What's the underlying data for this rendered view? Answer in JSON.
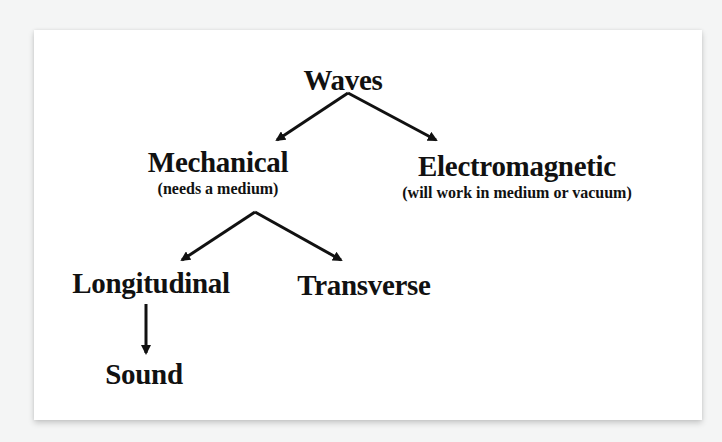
{
  "diagram": {
    "root": {
      "label": "Waves"
    },
    "level1": [
      {
        "label": "Mechanical",
        "note": "(needs a medium)"
      },
      {
        "label": "Electromagnetic",
        "note": "(will work in medium or vacuum)"
      }
    ],
    "level2": [
      {
        "label": "Longitudinal"
      },
      {
        "label": "Transverse"
      }
    ],
    "level3": [
      {
        "label": "Sound"
      }
    ],
    "edges": [
      {
        "from": "Waves",
        "to": "Mechanical"
      },
      {
        "from": "Waves",
        "to": "Electromagnetic"
      },
      {
        "from": "Mechanical",
        "to": "Longitudinal"
      },
      {
        "from": "Mechanical",
        "to": "Transverse"
      },
      {
        "from": "Longitudinal",
        "to": "Sound"
      }
    ],
    "colors": {
      "background": "#f4f5f5",
      "card": "#ffffff",
      "ink": "#111111"
    }
  }
}
